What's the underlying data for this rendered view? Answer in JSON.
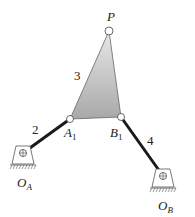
{
  "diagram": {
    "colors": {
      "coupler_fill_top": "#e6e6e6",
      "coupler_fill_bottom": "#a9a9a9",
      "link": "#1a1a1a",
      "ground": "#555555"
    },
    "links": [
      {
        "id": "2",
        "label": "2"
      },
      {
        "id": "3",
        "label": "3"
      },
      {
        "id": "4",
        "label": "4"
      }
    ],
    "points": {
      "P": {
        "label": "P"
      },
      "A1": {
        "label": "A",
        "sub": "1"
      },
      "B1": {
        "label": "B",
        "sub": "1"
      },
      "OA": {
        "label": "O",
        "sub": "A"
      },
      "OB": {
        "label": "O",
        "sub": "B"
      }
    }
  }
}
